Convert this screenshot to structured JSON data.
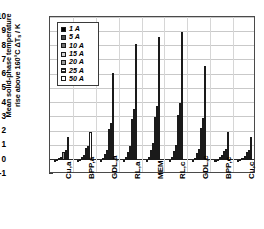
{
  "chart_data": {
    "type": "bar",
    "title": "",
    "xlabel": "",
    "ylabel": "Mean solid-phase temperature rise above 160°C  ΔTs / K",
    "ylabel_line1": "Mean solid-phase temperature",
    "ylabel_line2": "rise above 160°C  ΔT",
    "ylabel_line2b": "s",
    "ylabel_line2c": " / K",
    "ylim": [
      -1,
      10
    ],
    "yticks": [
      -1,
      0,
      1,
      2,
      3,
      4,
      5,
      6,
      7,
      8,
      9,
      10
    ],
    "ytick_labels": [
      "-1",
      "0",
      "1",
      "2",
      "3",
      "4",
      "5",
      "6",
      "7",
      "8",
      "9",
      "10"
    ],
    "grid": true,
    "legend_position": "top-left",
    "categories": [
      "Cu,a",
      "BPP,a",
      "GDL,a",
      "RL,a",
      "MEM",
      "RL,c",
      "GDL,c",
      "BPP,c",
      "Cu,c"
    ],
    "series": [
      {
        "name": "1 A",
        "values": [
          -0.02,
          -0.03,
          -0.18,
          -0.15,
          -0.13,
          -0.15,
          -0.17,
          -0.04,
          -0.02
        ]
      },
      {
        "name": "5 A",
        "values": [
          0.04,
          0.06,
          0.12,
          0.18,
          0.22,
          0.2,
          0.14,
          0.06,
          0.04
        ]
      },
      {
        "name": "10 A",
        "values": [
          0.12,
          0.18,
          0.4,
          0.55,
          0.68,
          0.6,
          0.45,
          0.2,
          0.14
        ]
      },
      {
        "name": "15 A",
        "values": [
          0.22,
          0.33,
          0.7,
          0.95,
          1.15,
          1.02,
          0.78,
          0.35,
          0.25
        ]
      },
      {
        "name": "20 A",
        "values": [
          0.55,
          0.82,
          2.12,
          2.82,
          3.0,
          3.1,
          2.25,
          0.62,
          0.55
        ]
      },
      {
        "name": "25 A",
        "values": [
          0.7,
          0.95,
          2.6,
          3.55,
          3.78,
          3.95,
          2.92,
          0.72,
          0.68
        ]
      },
      {
        "name": "50 A",
        "values": [
          1.62,
          1.92,
          6.1,
          8.12,
          8.6,
          8.95,
          6.58,
          1.92,
          1.62
        ]
      }
    ],
    "series_colors": [
      "#000000",
      "#4b4b4b",
      "#6f6f6f",
      "#d2d2d2",
      "#9a9a9a",
      "#ffffff",
      "#ffffff"
    ],
    "series_patterns": [
      "solid",
      "solid",
      "solid",
      "solid",
      "cross-hatch",
      "horizontal-lines",
      "solid"
    ]
  },
  "legend": {
    "items": [
      {
        "label": "1 A"
      },
      {
        "label": "5 A"
      },
      {
        "label": "10 A"
      },
      {
        "label": "15 A"
      },
      {
        "label": "20 A"
      },
      {
        "label": "25 A"
      },
      {
        "label": "50 A"
      }
    ]
  }
}
